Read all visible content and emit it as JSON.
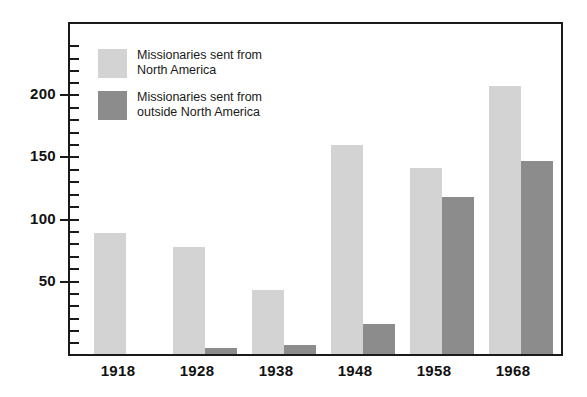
{
  "chart_data": {
    "type": "bar",
    "title": "",
    "subtitle": "",
    "xlabel": "",
    "ylabel": "",
    "categories": [
      "1918",
      "1928",
      "1938",
      "1948",
      "1958",
      "1968"
    ],
    "series": [
      {
        "name": "Missionaries sent from North America",
        "color": "#d3d3d3",
        "values": [
          97,
          86,
          51,
          168,
          149,
          215
        ]
      },
      {
        "name": "Missionaries sent from outside North America",
        "color": "#8c8c8c",
        "values": [
          0,
          5,
          7,
          24,
          126,
          155
        ]
      }
    ],
    "ylim": [
      0,
      240
    ],
    "y_major_ticks": [
      50,
      100,
      150,
      200
    ],
    "y_tick_labels": [
      "50",
      "100",
      "150",
      "200"
    ],
    "y_minor_tick_interval": 10,
    "grid": false,
    "legend_position": "inside-top-left",
    "frame": true
  },
  "legend": {
    "entries": [
      {
        "swatch": "light",
        "label": "Missionaries sent from\nNorth America"
      },
      {
        "swatch": "dark",
        "label": "Missionaries sent from\noutside North America"
      }
    ]
  },
  "axis": {
    "y_labels": [
      "200",
      "150",
      "100",
      "50"
    ],
    "x_labels": [
      "1918",
      "1928",
      "1938",
      "1948",
      "1958",
      "1968"
    ]
  },
  "colors": {
    "light_bar": "#d3d3d3",
    "dark_bar": "#8c8c8c",
    "frame": "#1a1a1a",
    "text": "#111111",
    "background": "#ffffff"
  }
}
